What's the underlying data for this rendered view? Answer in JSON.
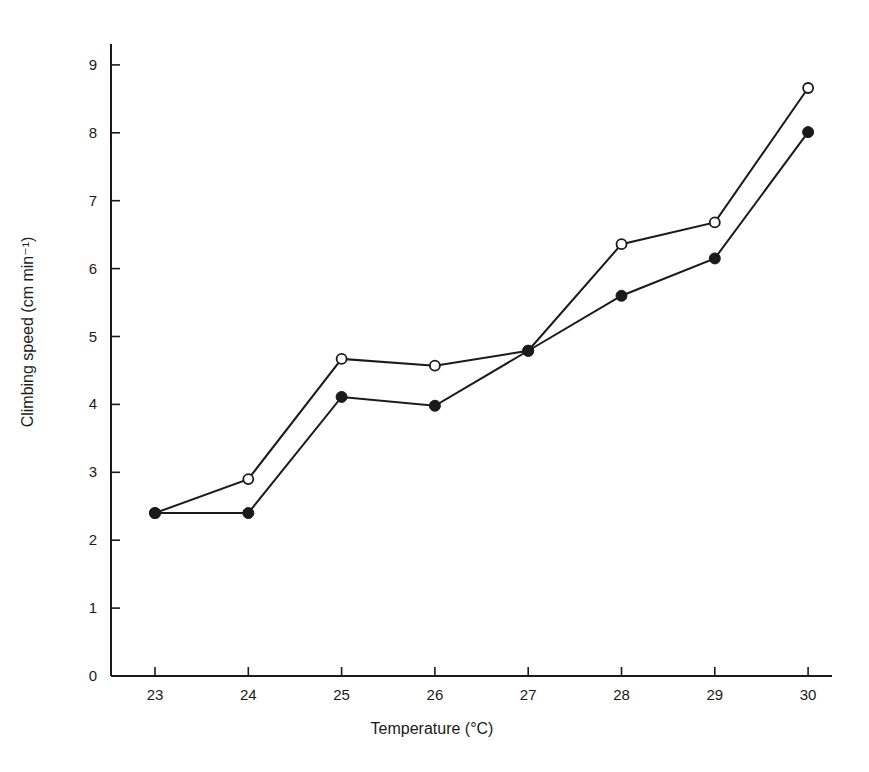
{
  "chart_data": {
    "type": "line",
    "title": "",
    "xlabel": "Temperature (°C)",
    "ylabel": "Climbing speed (cm min⁻¹)",
    "x": [
      23,
      24,
      25,
      26,
      27,
      28,
      29,
      30
    ],
    "x_ticks": [
      "23",
      "24",
      "25",
      "26",
      "27",
      "28",
      "29",
      "30"
    ],
    "y_ticks": [
      "0",
      "1",
      "2",
      "3",
      "4",
      "5",
      "6",
      "7",
      "8",
      "9"
    ],
    "xlim": [
      22.5,
      30.25
    ],
    "ylim": [
      0,
      9.5
    ],
    "grid": false,
    "legend": null,
    "series": [
      {
        "name": "open circles",
        "marker": "open-circle",
        "values": [
          2.4,
          2.9,
          4.67,
          4.57,
          4.79,
          6.36,
          6.68,
          8.66
        ]
      },
      {
        "name": "filled circles",
        "marker": "filled-circle",
        "values": [
          2.4,
          2.4,
          4.11,
          3.98,
          4.79,
          5.6,
          6.15,
          8.01
        ]
      }
    ],
    "colors": {
      "line": "#1a1a1a",
      "background": "#ffffff"
    }
  }
}
